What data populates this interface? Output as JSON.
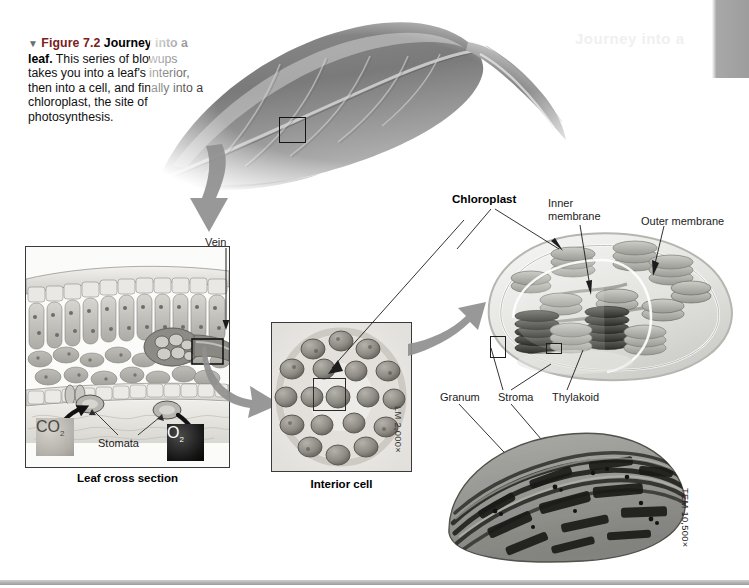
{
  "figure": {
    "marker": "▼",
    "number": "Figure 7.2",
    "title": "Journey into a leaf.",
    "caption": " This series of blowups takes you into a leaf's interior, then into a cell, and finally into a chloroplast, the site of photosynthesis."
  },
  "ghost_text": "Journey into a",
  "panels": {
    "leaf_photo": {
      "name": "leaf-photograph"
    },
    "leaf_cross_section": {
      "label": "Leaf cross section",
      "annotations": {
        "vein": "Vein",
        "stomata": "Stomata",
        "co2": "CO2",
        "co2_sub": "2",
        "co2_main": "CO",
        "o2_main": "O",
        "o2_sub": "2"
      }
    },
    "interior_cell": {
      "label": "Interior cell",
      "magnification": "LM 2,000×"
    },
    "chloroplast": {
      "label": "Chloroplast",
      "annotations": {
        "inner_membrane": "Inner membrane",
        "outer_membrane": "Outer membrane",
        "granum": "Granum",
        "stroma": "Stroma",
        "thylakoid": "Thylakoid"
      }
    },
    "tem": {
      "magnification": "TEM 10,500×"
    }
  },
  "colors": {
    "figure_number": "#7a2020",
    "arrow_gray": "#9a9a9a",
    "page_tab": "#a0a0a0",
    "co2_fill": "#b3b0aa",
    "o2_fill": "#141414"
  }
}
